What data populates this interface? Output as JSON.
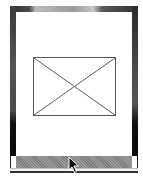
{
  "widget": {
    "type": "picture-frame",
    "content": {
      "icon": "broken-image-icon",
      "state": "image-not-loaded"
    }
  },
  "colors": {
    "frame_dark": "#3a3a3a",
    "frame_highlight": "#c8c8c8",
    "canvas": "#ffffff",
    "placeholder_stroke": "#555555",
    "hatch_bar": "#8a8a8a"
  },
  "cursor": {
    "icon": "arrow-cursor-icon",
    "x": 69,
    "y": 157
  }
}
